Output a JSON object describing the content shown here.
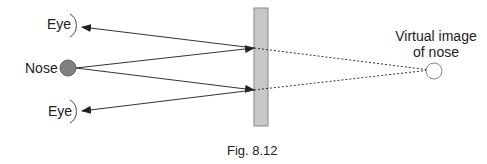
{
  "labels": {
    "eye_top": "Eye",
    "nose": "Nose",
    "eye_bottom": "Eye",
    "virtual_line1": "Virtual image",
    "virtual_line2": "of nose"
  },
  "caption": "Fig. 8.12",
  "colors": {
    "mirror_fill": "#c8c8c8",
    "nose_fill": "#808080",
    "line": "#333333"
  }
}
